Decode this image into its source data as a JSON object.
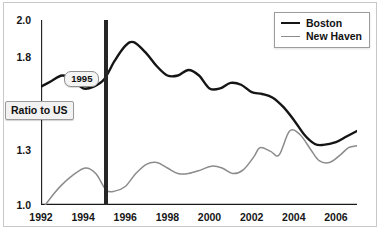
{
  "chart_data": {
    "type": "line",
    "title": "",
    "subtitle": "",
    "xlabel": "",
    "ylabel": "Ratio to US",
    "xlim": [
      1992,
      2007
    ],
    "ylim": [
      1.0,
      2.0
    ],
    "grid": false,
    "legend_position": "top-right",
    "x_ticks": [
      "1992",
      "1994",
      "1996",
      "1998",
      "2000",
      "2002",
      "2004",
      "2006"
    ],
    "x_tick_values": [
      1992,
      1994,
      1996,
      1998,
      2000,
      2002,
      2004,
      2006
    ],
    "x_minor_tick_values": [
      1993,
      1995,
      1997,
      1999,
      2001,
      2003,
      2005
    ],
    "y_ticks": [
      "1.0",
      "1.3",
      "1.8",
      "2.0"
    ],
    "y_tick_values": [
      1.0,
      1.3,
      1.8,
      2.0
    ],
    "annotations": [
      {
        "label": "1995",
        "x": 1995.1,
        "type": "vertical-marker"
      }
    ],
    "series": [
      {
        "name": "Boston",
        "color": "#151515",
        "x": [
          1992.0,
          1992.5,
          1993.0,
          1993.5,
          1994.0,
          1994.5,
          1995.0,
          1995.5,
          1996.0,
          1996.4,
          1997.0,
          1997.5,
          1998.0,
          1998.5,
          1999.0,
          1999.5,
          2000.0,
          2000.5,
          2001.0,
          2001.5,
          2002.0,
          2002.5,
          2003.0,
          2003.5,
          2004.0,
          2004.5,
          2005.0,
          2005.4,
          2006.0,
          2006.5,
          2007.0
        ],
        "values": [
          1.64,
          1.67,
          1.7,
          1.68,
          1.63,
          1.64,
          1.68,
          1.78,
          1.86,
          1.88,
          1.82,
          1.75,
          1.7,
          1.7,
          1.73,
          1.7,
          1.63,
          1.63,
          1.66,
          1.65,
          1.61,
          1.6,
          1.58,
          1.53,
          1.46,
          1.38,
          1.33,
          1.325,
          1.34,
          1.37,
          1.4
        ]
      },
      {
        "name": "New Haven",
        "color": "#8b8b8b",
        "x": [
          1992.2,
          1992.6,
          1993.0,
          1993.5,
          1994.1,
          1994.6,
          1995.1,
          1995.5,
          1996.0,
          1996.5,
          1997.0,
          1997.5,
          1998.0,
          1998.5,
          1999.0,
          1999.6,
          2000.1,
          2000.6,
          2001.1,
          2001.6,
          2002.1,
          2002.4,
          2002.9,
          2003.3,
          2003.8,
          2004.3,
          2004.8,
          2005.2,
          2005.7,
          2006.2,
          2006.6,
          2007.0
        ],
        "values": [
          1.0,
          1.06,
          1.11,
          1.16,
          1.2,
          1.17,
          1.08,
          1.075,
          1.1,
          1.17,
          1.22,
          1.23,
          1.2,
          1.17,
          1.17,
          1.19,
          1.21,
          1.2,
          1.17,
          1.19,
          1.26,
          1.31,
          1.29,
          1.27,
          1.4,
          1.38,
          1.3,
          1.24,
          1.23,
          1.27,
          1.31,
          1.32
        ]
      }
    ]
  },
  "legend": {
    "items": [
      {
        "label": "Boston"
      },
      {
        "label": "New Haven"
      }
    ]
  },
  "axis_title": {
    "text": "Ratio to US"
  },
  "event_marker": {
    "label": "1995"
  }
}
